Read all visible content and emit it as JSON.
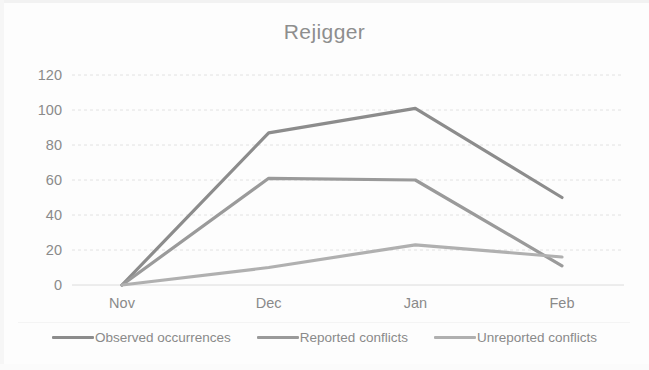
{
  "chart_data": {
    "type": "line",
    "title": "Rejigger",
    "xlabel": "",
    "ylabel": "",
    "categories": [
      "Nov",
      "Dec",
      "Jan",
      "Feb"
    ],
    "series": [
      {
        "name": "Observed occurrences",
        "values": [
          0,
          87,
          101,
          50
        ],
        "color": "#8c8c8c"
      },
      {
        "name": "Reported conflicts",
        "values": [
          0,
          61,
          60,
          11
        ],
        "color": "#9a9a9a"
      },
      {
        "name": "Unreported conflicts",
        "values": [
          0,
          10,
          23,
          16
        ],
        "color": "#b0b0b0"
      }
    ],
    "ylim": [
      0,
      120
    ],
    "y_ticks": [
      "0",
      "20",
      "40",
      "60",
      "80",
      "100",
      "120"
    ],
    "x_ticks": [
      "Nov",
      "Dec",
      "Jan",
      "Feb"
    ],
    "grid": true,
    "grid_style": "horizontal-dashed",
    "legend_position": "bottom"
  },
  "legend": {
    "entries": [
      {
        "label": "Observed occurrences"
      },
      {
        "label": "Reported conflicts"
      },
      {
        "label": "Unreported conflicts"
      }
    ]
  },
  "axes": {
    "y_labels": [
      "120",
      "100",
      "80",
      "60",
      "40",
      "20",
      "0"
    ],
    "x_labels": [
      "Nov",
      "Dec",
      "Jan",
      "Feb"
    ]
  },
  "colors": {
    "series_1": "#8c8c8c",
    "series_2": "#9a9a9a",
    "series_3": "#b0b0b0",
    "grid": "#e2e2e2",
    "text": "#8a8a8a"
  }
}
